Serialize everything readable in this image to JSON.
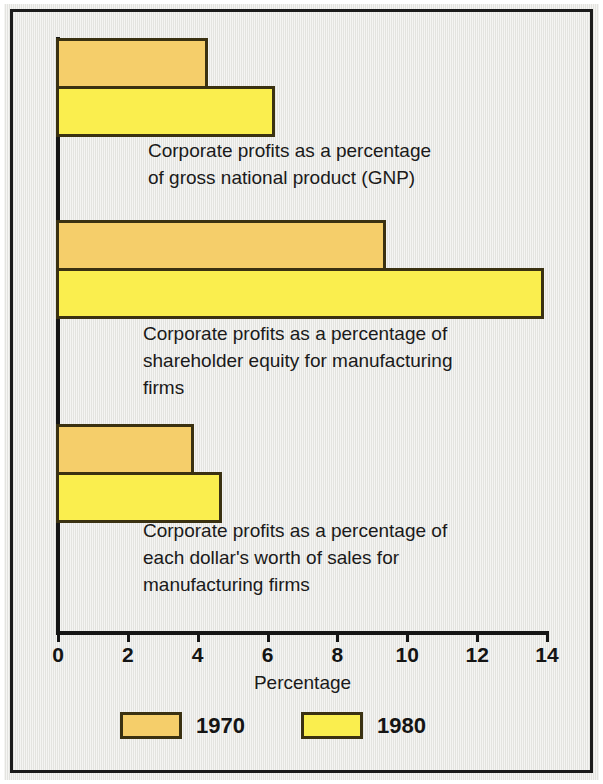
{
  "chart_data": {
    "type": "bar",
    "orientation": "horizontal",
    "title": "",
    "xlabel": "Percentage",
    "ylabel": "",
    "xlim": [
      0,
      14
    ],
    "xticks": [
      0,
      2,
      4,
      6,
      8,
      10,
      12,
      14
    ],
    "tick_labels": [
      "0",
      "2",
      "4",
      "6",
      "8",
      "10",
      "12",
      "14"
    ],
    "grid": false,
    "legend_position": "bottom",
    "categories": [
      "Corporate profits as a percentage\nof gross national product (GNP)",
      "Corporate profits as a percentage of\nshareholder equity for manufacturing\nfirms",
      "Corporate profits as a percentage of\neach dollar's worth of sales for\nmanufacturing firms"
    ],
    "series": [
      {
        "name": "1970",
        "color": "#f5ce6a",
        "values": [
          4.3,
          9.4,
          3.9
        ]
      },
      {
        "name": "1980",
        "color": "#faee4e",
        "values": [
          6.2,
          13.9,
          4.7
        ]
      }
    ]
  },
  "colors": {
    "bar_1970": "#f5ce6a",
    "bar_1980": "#faee4e",
    "bar_outline": "#3a3111",
    "axis": "#161616",
    "background": "#e8e8e4",
    "frame": "#1b1b1b",
    "text": "#1a1a1a"
  },
  "legend": {
    "items": [
      {
        "label": "1970"
      },
      {
        "label": "1980"
      }
    ]
  }
}
